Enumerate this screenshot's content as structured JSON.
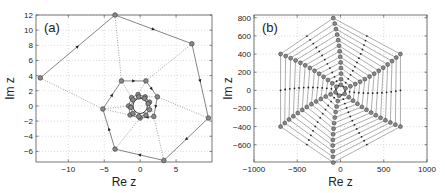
{
  "chart_data": [
    {
      "type": "line",
      "panel_label": "(a)",
      "xlabel": "Re z",
      "ylabel": "Im z",
      "xlim": [
        -14.5,
        10
      ],
      "ylim": [
        -7.4,
        12
      ],
      "xticks": [
        -10,
        -5,
        0,
        5
      ],
      "xtick_labels": [
        "−10",
        "−5",
        "0",
        "5"
      ],
      "yticks": [
        -6,
        -4,
        -2,
        0,
        2,
        4,
        6,
        8,
        10,
        12
      ],
      "ytick_labels": [
        "−6",
        "−4",
        "−2",
        "0",
        "2",
        "4",
        "6",
        "8",
        "10",
        "12"
      ],
      "grid": true,
      "series": [
        {
          "name": "iterates",
          "style": "solid-with-markers",
          "points": [
            [
              -13.9,
              3.7
            ],
            [
              -3.5,
              12.0
            ],
            [
              7.2,
              8.2
            ],
            [
              9.5,
              -1.6
            ],
            [
              3.3,
              -7.2
            ],
            [
              -3.5,
              -5.7
            ],
            [
              -5.2,
              -0.4
            ],
            [
              -2.6,
              3.3
            ],
            [
              0.8,
              3.3
            ],
            [
              2.4,
              1.2
            ],
            [
              1.9,
              -1.4
            ],
            [
              0.0,
              -1.6
            ],
            [
              -1.4,
              -1.2
            ],
            [
              -1.6,
              0.0
            ],
            [
              -1.2,
              1.1
            ],
            [
              -0.3,
              1.5
            ],
            [
              0.7,
              1.2
            ],
            [
              1.3,
              0.5
            ],
            [
              1.3,
              -0.5
            ],
            [
              0.8,
              -1.2
            ],
            [
              -0.2,
              -1.4
            ],
            [
              -1.0,
              -1.0
            ],
            [
              -1.3,
              -0.2
            ],
            [
              -1.0,
              0.8
            ],
            [
              -0.2,
              1.2
            ],
            [
              0.6,
              1.0
            ],
            [
              1.1,
              0.3
            ]
          ]
        },
        {
          "name": "connectors",
          "style": "dotted",
          "segments": [
            [
              [
                -13.9,
                3.7
              ],
              [
                -5.2,
                -0.4
              ]
            ],
            [
              [
                -5.2,
                -0.4
              ],
              [
                -1.6,
                0.0
              ]
            ],
            [
              [
                -3.5,
                12.0
              ],
              [
                -2.6,
                3.3
              ]
            ],
            [
              [
                -2.6,
                3.3
              ],
              [
                -1.2,
                1.1
              ]
            ],
            [
              [
                7.2,
                8.2
              ],
              [
                0.8,
                3.3
              ]
            ],
            [
              [
                0.8,
                3.3
              ],
              [
                -0.3,
                1.5
              ]
            ],
            [
              [
                9.5,
                -1.6
              ],
              [
                2.4,
                1.2
              ]
            ],
            [
              [
                2.4,
                1.2
              ],
              [
                0.7,
                1.2
              ]
            ],
            [
              [
                3.3,
                -7.2
              ],
              [
                1.9,
                -1.4
              ]
            ],
            [
              [
                1.9,
                -1.4
              ],
              [
                1.3,
                0.5
              ]
            ],
            [
              [
                -3.5,
                -5.7
              ],
              [
                0.0,
                -1.6
              ]
            ],
            [
              [
                0.0,
                -1.6
              ],
              [
                0.8,
                -1.2
              ]
            ],
            [
              [
                -5.2,
                -0.4
              ],
              [
                -1.4,
                -1.2
              ]
            ]
          ]
        }
      ],
      "fixed_circle": {
        "center": [
          0,
          0
        ],
        "radius": 1
      }
    },
    {
      "type": "line",
      "panel_label": "(b)",
      "xlabel": "Re z",
      "ylabel": "Im z",
      "xlim": [
        -1000,
        1000
      ],
      "ylim": [
        -790,
        830
      ],
      "xticks": [
        -1000,
        -500,
        0,
        500,
        1000
      ],
      "xtick_labels": [
        "−1000",
        "−500",
        "0",
        "500",
        "1000"
      ],
      "yticks": [
        -600,
        -400,
        -200,
        0,
        200,
        400,
        600,
        800
      ],
      "ytick_labels": [
        "−600",
        "−400",
        "−200",
        "0",
        "200",
        "400",
        "600",
        "800"
      ],
      "grid": true,
      "spiral": {
        "rings": 13,
        "max_radius": 800,
        "vertex_angles_deg": [
          96,
          30,
          -30,
          -96,
          -150,
          150
        ],
        "mid_angles_deg": [
          60,
          0,
          -60,
          -120,
          180,
          120
        ],
        "rotation_per_ring_deg": -0.8
      }
    }
  ]
}
